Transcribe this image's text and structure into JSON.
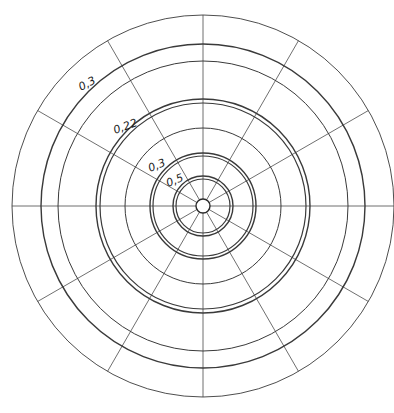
{
  "diagram": {
    "type": "polar-grid",
    "center": {
      "x": 203,
      "y": 206
    },
    "spoke_angles_deg": [
      0,
      30,
      60,
      90,
      120,
      150,
      180,
      210,
      240,
      270,
      300,
      330
    ],
    "spoke_inner_radius": 7,
    "spoke_outer_radius": 191,
    "rings": [
      {
        "r": 191,
        "width": 0.9,
        "color": "#555555"
      },
      {
        "r": 162,
        "width": 1.4,
        "color": "#2a2a2a"
      },
      {
        "r": 145,
        "width": 1.0,
        "color": "#444444"
      },
      {
        "r": 107,
        "width": 1.4,
        "color": "#2a2a2a"
      },
      {
        "r": 103,
        "width": 1.2,
        "color": "#333333"
      },
      {
        "r": 78,
        "width": 1.0,
        "color": "#444444"
      },
      {
        "r": 53,
        "width": 1.4,
        "color": "#2a2a2a"
      },
      {
        "r": 50,
        "width": 1.2,
        "color": "#333333"
      },
      {
        "r": 30,
        "width": 1.4,
        "color": "#2a2a2a"
      },
      {
        "r": 27,
        "width": 1.2,
        "color": "#333333"
      }
    ],
    "hub_radius": 7,
    "labels": [
      {
        "text": "0,3",
        "x": 81,
        "y": 91,
        "rotate": -28
      },
      {
        "text": "0,22",
        "x": 115,
        "y": 134,
        "rotate": -20
      },
      {
        "text": "0,3",
        "x": 150,
        "y": 172,
        "rotate": -22
      },
      {
        "text": "0,5",
        "x": 168,
        "y": 187,
        "rotate": -22
      }
    ]
  }
}
